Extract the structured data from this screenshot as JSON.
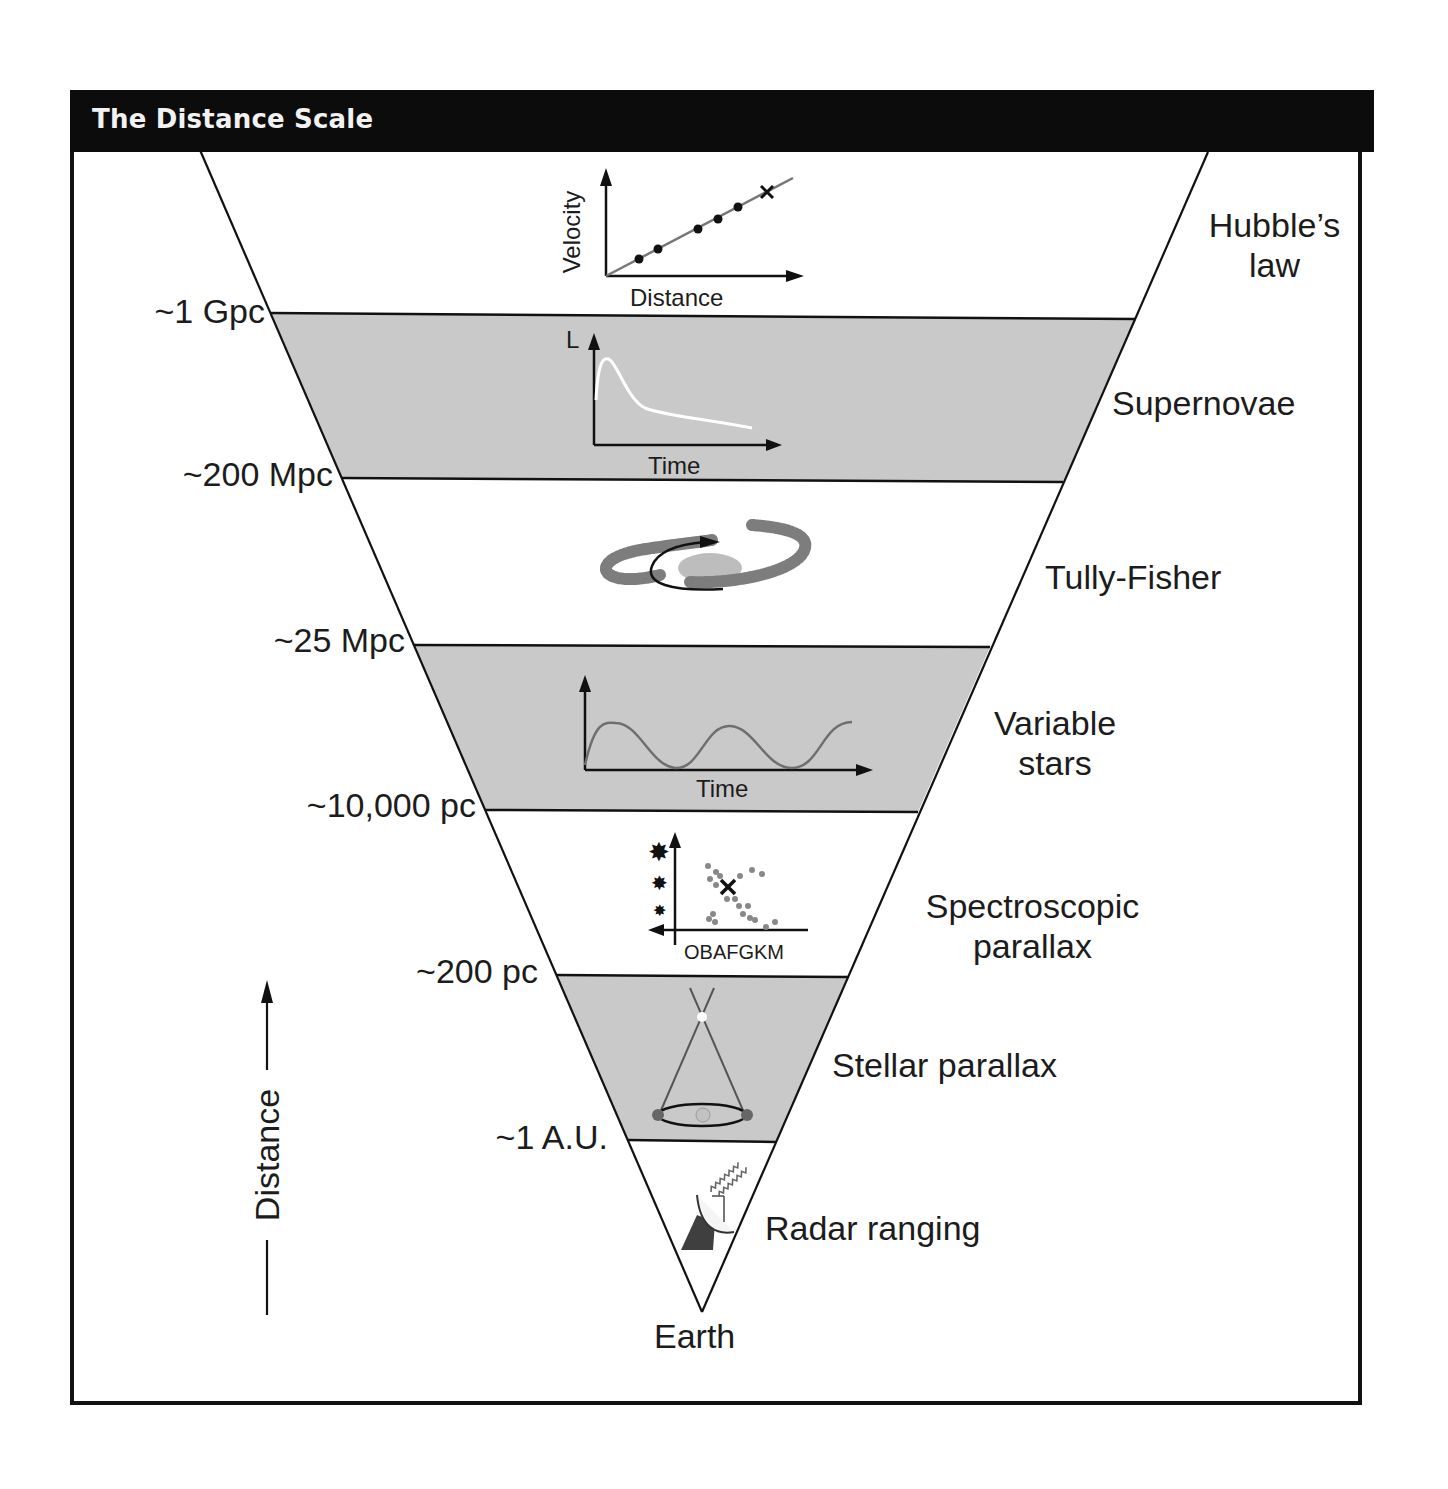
{
  "header": {
    "title": "The Distance Scale"
  },
  "axis": {
    "label": "Distance",
    "direction": "up"
  },
  "apex_label": "Earth",
  "distance_markers": [
    {
      "label": "~1 Gpc",
      "y": 313
    },
    {
      "label": "~200 Mpc",
      "y": 478
    },
    {
      "label": "~25 Mpc",
      "y": 645
    },
    {
      "label": "~10,000 pc",
      "y": 810
    },
    {
      "label": "~200 pc",
      "y": 975
    },
    {
      "label": "~1 A.U.",
      "y": 1140
    }
  ],
  "methods": [
    {
      "name": "Hubble's law",
      "lines": [
        "Hubble’s",
        "law"
      ],
      "band": "top",
      "shaded": false,
      "inset": {
        "type": "line-scatter",
        "xlabel": "Distance",
        "ylabel": "Velocity",
        "points": 5,
        "marker": "x"
      }
    },
    {
      "name": "Supernovae",
      "lines": [
        "Supernovae"
      ],
      "band": "~1 Gpc to ~200 Mpc",
      "shaded": true,
      "inset": {
        "type": "light-curve",
        "xlabel": "Time",
        "ylabel": "L"
      }
    },
    {
      "name": "Tully-Fisher",
      "lines": [
        "Tully-Fisher"
      ],
      "band": "~200 Mpc to ~25 Mpc",
      "shaded": false,
      "inset": {
        "type": "rotating-spiral-galaxy"
      }
    },
    {
      "name": "Variable stars",
      "lines": [
        "Variable",
        "stars"
      ],
      "band": "~25 Mpc to ~10,000 pc",
      "shaded": true,
      "inset": {
        "type": "periodic-curve",
        "xlabel": "Time"
      }
    },
    {
      "name": "Spectroscopic parallax",
      "lines": [
        "Spectroscopic",
        "parallax"
      ],
      "band": "~10,000 pc to ~200 pc",
      "shaded": false,
      "inset": {
        "type": "hr-diagram",
        "xlabel": "OBAFGKM"
      }
    },
    {
      "name": "Stellar parallax",
      "lines": [
        "Stellar parallax"
      ],
      "band": "~200 pc to ~1 A.U.",
      "shaded": true,
      "inset": {
        "type": "parallax-geometry"
      }
    },
    {
      "name": "Radar ranging",
      "lines": [
        "Radar ranging"
      ],
      "band": "~1 A.U. to Earth",
      "shaded": false,
      "inset": {
        "type": "radar-dish"
      }
    }
  ],
  "insets": {
    "hubble": {
      "xlabel": "Distance",
      "ylabel": "Velocity"
    },
    "supernova": {
      "xlabel": "Time",
      "ylabel": "L"
    },
    "variable": {
      "xlabel": "Time"
    },
    "hr": {
      "xlabel": "OBAFGKM"
    }
  },
  "colors": {
    "band_shade": "#c9c9c9",
    "line": "#111111",
    "header_bg": "#0c0c0c",
    "header_text": "#f2f2f2",
    "curve_gray": "#6f6f6f"
  }
}
